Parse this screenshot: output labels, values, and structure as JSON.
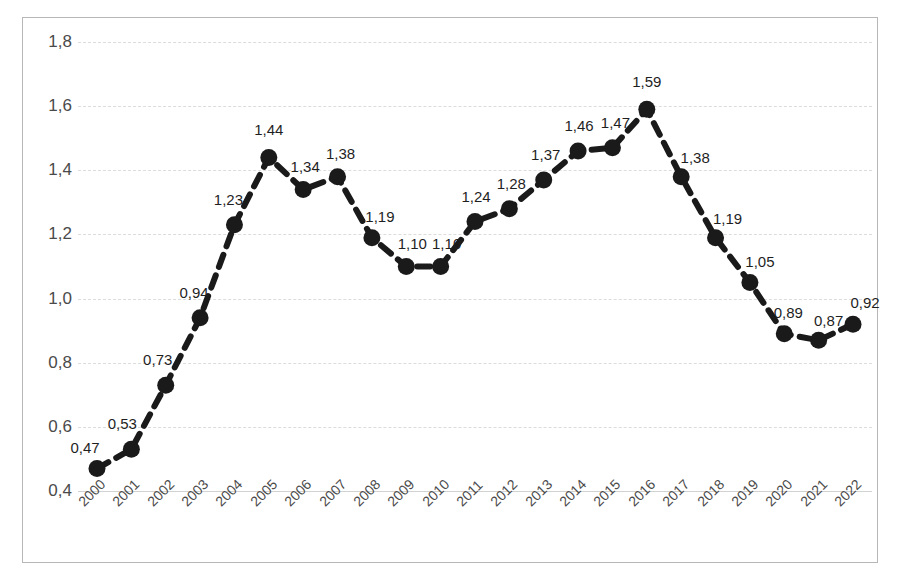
{
  "title_fragment": "статистика",
  "chart_data": {
    "type": "line",
    "title": "",
    "xlabel": "",
    "ylabel": "",
    "categories": [
      "2000",
      "2001",
      "2002",
      "2003",
      "2004",
      "2005",
      "2006",
      "2007",
      "2008",
      "2009",
      "2010",
      "2011",
      "2012",
      "2013",
      "2014",
      "2015",
      "2016",
      "2017",
      "2018",
      "2019",
      "2020",
      "2021",
      "2022"
    ],
    "values": [
      0.47,
      0.53,
      0.73,
      0.94,
      1.23,
      1.44,
      1.34,
      1.38,
      1.19,
      1.1,
      1.1,
      1.24,
      1.28,
      1.37,
      1.46,
      1.47,
      1.59,
      1.38,
      1.19,
      1.05,
      0.89,
      0.87,
      0.92
    ],
    "data_labels": [
      "0,47",
      "0,53",
      "0,73",
      "0,94",
      "1,23",
      "1,44",
      "1,34",
      "1,38",
      "1,19",
      "1,10",
      "1,10",
      "1,24",
      "1,28",
      "1,37",
      "1,46",
      "1,47",
      "1,59",
      "1,38",
      "1,19",
      "1,05",
      "0,89",
      "0,87",
      "0,92"
    ],
    "ylim": [
      0.4,
      1.8
    ],
    "ytick_values": [
      0.4,
      0.6,
      0.8,
      1.0,
      1.2,
      1.4,
      1.6,
      1.8
    ],
    "ytick_labels": [
      "0,4",
      "0,6",
      "0,8",
      "1,0",
      "1,2",
      "1,4",
      "1,6",
      "1,8"
    ],
    "grid": true,
    "grid_style": "dashed-horizontal",
    "legend": "none",
    "series_color": "#1a1a1a",
    "marker": "circle",
    "line_style": "dashed",
    "decimal_separator": ","
  }
}
